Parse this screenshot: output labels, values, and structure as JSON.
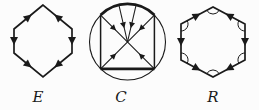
{
  "figure": {
    "background_color": "#fcfcfc",
    "ink_color": "#1a1a1a",
    "diagrams": [
      {
        "label": "E",
        "type": "hexagon-with-directed-edges",
        "description": "elongated hexagon, solid arrowheads on all six edges"
      },
      {
        "label": "C",
        "type": "circle-inscribed-square-with-radial-arrows",
        "description": "circle with inscribed square, bold top arc and bold bottom edge, diagonals and two upper chords with arrows converging at center"
      },
      {
        "label": "R",
        "type": "hexagon-with-directed-edges-and-vertex-arcs",
        "description": "hexagon, solid arrowheads on all six edges, small angle arc at each vertex"
      }
    ]
  }
}
